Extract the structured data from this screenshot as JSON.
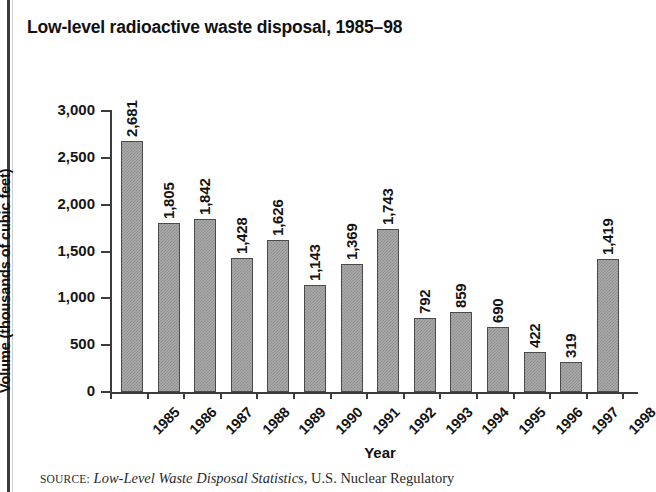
{
  "figure": {
    "title": "Low-level radioactive waste disposal, 1985–98",
    "source_label": "SOURCE:",
    "source_title": "Low-Level Waste Disposal Statistics",
    "source_rest": ", U.S. Nuclear Regulatory"
  },
  "chart_data": {
    "type": "bar",
    "title": "Low-level radioactive waste disposal, 1985–98",
    "xlabel": "Year",
    "ylabel": "Volume (thousands of cubic feet)",
    "categories": [
      "1985",
      "1986",
      "1987",
      "1988",
      "1989",
      "1990",
      "1991",
      "1992",
      "1993",
      "1994",
      "1995",
      "1996",
      "1997",
      "1998"
    ],
    "values": [
      2681,
      1805,
      1842,
      1428,
      1626,
      1143,
      1369,
      1743,
      792,
      859,
      690,
      422,
      319,
      1419
    ],
    "value_labels": [
      "2,681",
      "1,805",
      "1,842",
      "1,428",
      "1,626",
      "1,143",
      "1,369",
      "1,743",
      "792",
      "859",
      "690",
      "422",
      "319",
      "1,419"
    ],
    "ylim": [
      0,
      3000
    ],
    "yticks": [
      0,
      500,
      1000,
      1500,
      2000,
      2500,
      3000
    ],
    "ytick_labels": [
      "0",
      "500",
      "1,000",
      "1,500",
      "2,000",
      "2,500",
      "3,000"
    ],
    "grid": false,
    "legend": false,
    "bar_color": "#a9a9a9",
    "bar_edge_color": "#4a4a4a",
    "axis_color": "#3c3c3c"
  }
}
